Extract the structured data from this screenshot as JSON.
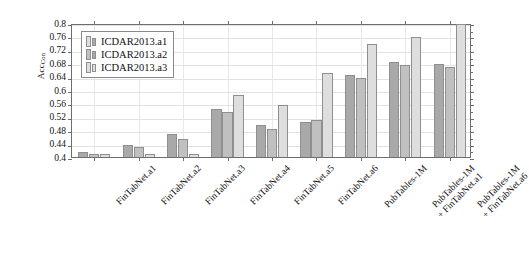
{
  "chart_data": {
    "type": "bar",
    "title": "",
    "xlabel": "",
    "ylabel": "Acc",
    "ylabel_sub": "Con",
    "ylim": [
      0.4,
      0.8
    ],
    "yticks": [
      "0.4",
      "0.44",
      "0.48",
      "0.52",
      "0.56",
      "0.6",
      "0.64",
      "0.68",
      "0.72",
      "0.76",
      "0.8"
    ],
    "grid": true,
    "legend_position": "upper-left",
    "categories": [
      "FinTabNet.a1",
      "FinTabNet.a2",
      "FinTabNet.a3",
      "FinTabNet.a4",
      "FinTabNet.a5",
      "FinTabNet.a6",
      "PubTables-1M",
      "PubTables-1M\n+ FinTabNet.a1",
      "PubTables-1M\n+ FinTabNet.a6"
    ],
    "category_lines": [
      [
        "FinTabNet.a1"
      ],
      [
        "FinTabNet.a2"
      ],
      [
        "FinTabNet.a3"
      ],
      [
        "FinTabNet.a4"
      ],
      [
        "FinTabNet.a5"
      ],
      [
        "FinTabNet.a6"
      ],
      [
        "PubTables-1M"
      ],
      [
        "PubTables-1M",
        "+ FinTabNet.a1"
      ],
      [
        "PubTables-1M",
        "+ FinTabNet.a6"
      ]
    ],
    "series": [
      {
        "name": "ICDAR2013.a1",
        "color": "#a9a9a9",
        "values": [
          0.415,
          0.435,
          0.468,
          0.543,
          0.497,
          0.505,
          0.646,
          0.684,
          0.677
        ]
      },
      {
        "name": "ICDAR2013.a2",
        "color": "#c0c0c0",
        "values": [
          0.408,
          0.43,
          0.455,
          0.534,
          0.484,
          0.51,
          0.637,
          0.676,
          0.668
        ]
      },
      {
        "name": "ICDAR2013.a3",
        "color": "#dedede",
        "values": [
          0.408,
          0.409,
          0.41,
          0.584,
          0.555,
          0.652,
          0.737,
          0.757,
          0.798
        ]
      }
    ]
  },
  "legend": {
    "entries": [
      {
        "label": "ICDAR2013.a1"
      },
      {
        "label": "ICDAR2013.a2"
      },
      {
        "label": "ICDAR2013.a3"
      }
    ]
  }
}
